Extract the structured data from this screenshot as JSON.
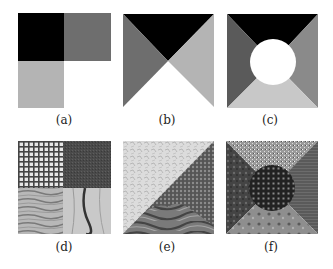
{
  "figure": {
    "panels": [
      {
        "id": "a",
        "label": "(a)",
        "description": "Three-region synthetic mosaic: black top-left, dark gray top-right, light gray bottom-left, white bottom-right"
      },
      {
        "id": "b",
        "label": "(b)",
        "description": "Four triangles meeting at center: black top, dark gray left, light gray right, white bottom"
      },
      {
        "id": "c",
        "label": "(c)",
        "description": "Four trapezoids around a central white circle: black top, dark gray left, mid gray right, light gray bottom"
      },
      {
        "id": "d",
        "label": "(d)",
        "description": "Four-quadrant texture mosaic: grid mesh, dark fine texture, wavy wood grain, marble"
      },
      {
        "id": "e",
        "label": "(e)",
        "description": "Three-region texture mosaic: light crumpled texture, hexagonal mesh, wood swirl"
      },
      {
        "id": "f",
        "label": "(f)",
        "description": "Five-region texture mosaic with circular grid center: speckled top, mottled left, striated right, stony bottom"
      }
    ],
    "colors": {
      "black": "#000000",
      "dark_gray": "#6e6e6e",
      "mid_gray": "#8a8a8a",
      "light_gray": "#b4b4b4",
      "lighter_gray": "#c8c8c8",
      "white": "#ffffff"
    }
  }
}
